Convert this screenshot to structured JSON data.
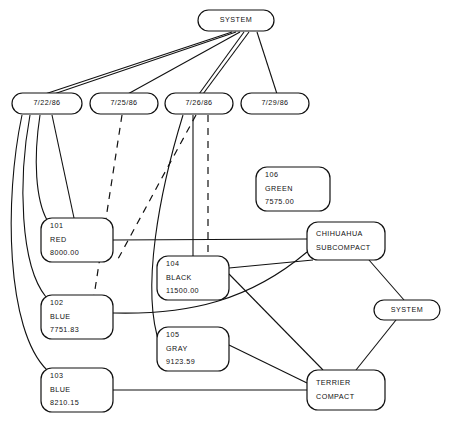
{
  "diagram": {
    "title": "SYSTEM",
    "type": "network-graph",
    "canvas": {
      "width": 450,
      "height": 424
    },
    "style": {
      "line_color": "#111111",
      "node_fill": "#ffffff",
      "node_stroke": "#111111",
      "background": "#ffffff"
    },
    "nodes": [
      {
        "id": "system-top",
        "name": "system-top-node",
        "shape": "rounded-rect",
        "lines": [
          "SYSTEM"
        ],
        "x": 198,
        "y": 10,
        "w": 76,
        "h": 21,
        "align": "center"
      },
      {
        "id": "date-722",
        "name": "date-node-7-22-86",
        "shape": "rounded-rect",
        "lines": [
          "7/22/86"
        ],
        "x": 12,
        "y": 93,
        "w": 70,
        "h": 21,
        "align": "center"
      },
      {
        "id": "date-725",
        "name": "date-node-7-25-86",
        "shape": "rounded-rect",
        "lines": [
          "7/25/86"
        ],
        "x": 90,
        "y": 93,
        "w": 68,
        "h": 21,
        "align": "center"
      },
      {
        "id": "date-726",
        "name": "date-node-7-26-86",
        "shape": "rounded-rect",
        "lines": [
          "7/26/86"
        ],
        "x": 165,
        "y": 93,
        "w": 68,
        "h": 21,
        "align": "center"
      },
      {
        "id": "date-729",
        "name": "date-node-7-29-86",
        "shape": "rounded-rect",
        "lines": [
          "7/29/86"
        ],
        "x": 241,
        "y": 93,
        "w": 68,
        "h": 21,
        "align": "center"
      },
      {
        "id": "item-106",
        "name": "item-node-106-green",
        "shape": "rounded-rect",
        "lines": [
          "106",
          "GREEN",
          "7575.00"
        ],
        "x": 256,
        "y": 167,
        "w": 74,
        "h": 44,
        "align": "left"
      },
      {
        "id": "item-101",
        "name": "item-node-101-red",
        "shape": "rounded-rect",
        "lines": [
          "101",
          "RED",
          "8000.00"
        ],
        "x": 41,
        "y": 218,
        "w": 72,
        "h": 44,
        "align": "left"
      },
      {
        "id": "item-104",
        "name": "item-node-104-black",
        "shape": "rounded-rect",
        "lines": [
          "104",
          "BLACK",
          "11500.00"
        ],
        "x": 157,
        "y": 256,
        "w": 72,
        "h": 44,
        "align": "left"
      },
      {
        "id": "item-102",
        "name": "item-node-102-blue",
        "shape": "rounded-rect",
        "lines": [
          "102",
          "BLUE",
          "7751.83"
        ],
        "x": 41,
        "y": 295,
        "w": 72,
        "h": 44,
        "align": "left"
      },
      {
        "id": "item-105",
        "name": "item-node-105-gray",
        "shape": "rounded-rect",
        "lines": [
          "105",
          "GRAY",
          "9123.59"
        ],
        "x": 157,
        "y": 327,
        "w": 72,
        "h": 44,
        "align": "left"
      },
      {
        "id": "item-103",
        "name": "item-node-103-blue",
        "shape": "rounded-rect",
        "lines": [
          "103",
          "BLUE",
          "8210.15"
        ],
        "x": 41,
        "y": 368,
        "w": 72,
        "h": 44,
        "align": "left"
      },
      {
        "id": "chihuahua",
        "name": "model-node-chihuahua-subcompact",
        "shape": "rounded-rect",
        "lines": [
          "CHIHUAHUA",
          "SUBCOMPACT"
        ],
        "x": 307,
        "y": 222,
        "w": 78,
        "h": 38,
        "align": "left"
      },
      {
        "id": "system-right",
        "name": "system-right-node",
        "shape": "rounded-rect",
        "lines": [
          "SYSTEM"
        ],
        "x": 374,
        "y": 300,
        "w": 66,
        "h": 20,
        "align": "center"
      },
      {
        "id": "terrier",
        "name": "model-node-terrier-compact",
        "shape": "rounded-rect",
        "lines": [
          "TERRIER",
          "COMPACT"
        ],
        "x": 307,
        "y": 370,
        "w": 78,
        "h": 40,
        "align": "left"
      }
    ],
    "edges": [
      {
        "name": "edge-system-to-7-22-86",
        "style": "solid",
        "path": "M 232 32 L 42 95"
      },
      {
        "name": "edge-system-to-7-22-86-b",
        "style": "solid",
        "path": "M 236 32 L 48 96"
      },
      {
        "name": "edge-system-to-7-25-86",
        "style": "solid",
        "path": "M 240 32 L 126 95"
      },
      {
        "name": "edge-system-to-7-26-86",
        "style": "solid",
        "path": "M 244 32 L 199 94"
      },
      {
        "name": "edge-system-to-7-26-86-b",
        "style": "solid",
        "path": "M 249 32 L 203 94"
      },
      {
        "name": "edge-system-to-7-29-86",
        "style": "solid",
        "path": "M 257 32 L 277 94"
      },
      {
        "name": "edge-7-22-86-to-101",
        "style": "solid",
        "path": "M 40 115 C 33 160 36 200 47 220"
      },
      {
        "name": "edge-7-22-86-to-102",
        "style": "solid",
        "path": "M 30 115 C 18 180 20 265 46 297"
      },
      {
        "name": "edge-7-22-86-to-103",
        "style": "solid",
        "path": "M 22 115 C 4 200 6 330 47 370"
      },
      {
        "name": "edge-7-22-86-to-101-top",
        "style": "solid",
        "path": "M 52 115 L 74 218"
      },
      {
        "name": "edge-7-25-86-to-102-dashed",
        "style": "dashed",
        "path": "M 122 115 L 94 296"
      },
      {
        "name": "edge-7-26-86-to-101-dashed",
        "style": "dashed",
        "path": "M 196 115 L 118 259"
      },
      {
        "name": "edge-7-26-86-to-104-dashed",
        "style": "dashed",
        "path": "M 208 115 L 208 256"
      },
      {
        "name": "edge-7-26-86-to-104",
        "style": "solid",
        "path": "M 193 115 L 193 256"
      },
      {
        "name": "edge-7-26-86-to-105",
        "style": "solid",
        "path": "M 183 115 C 160 190 140 290 160 345"
      },
      {
        "name": "edge-101-to-chihuahua",
        "style": "solid",
        "path": "M 113 240 L 307 239"
      },
      {
        "name": "edge-102-to-chihuahua",
        "style": "solid",
        "path": "M 113 313 C 190 315 250 300 307 252"
      },
      {
        "name": "edge-103-to-terrier",
        "style": "solid",
        "path": "M 113 390 L 307 390"
      },
      {
        "name": "edge-104-to-terrier",
        "style": "solid",
        "path": "M 229 274 L 323 370"
      },
      {
        "name": "edge-105-to-terrier",
        "style": "solid",
        "path": "M 229 345 L 307 383"
      },
      {
        "name": "edge-chihuahua-to-system-right",
        "style": "solid",
        "path": "M 369 260 L 404 300"
      },
      {
        "name": "edge-system-right-to-terrier",
        "style": "solid",
        "path": "M 396 320 L 356 370"
      },
      {
        "name": "edge-chihuahua-to-104",
        "style": "solid",
        "path": "M 313 260 L 229 268"
      }
    ]
  }
}
